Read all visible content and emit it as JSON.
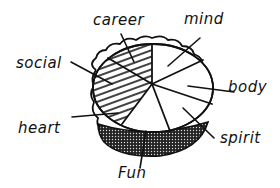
{
  "illustration": {
    "subject": "life balance pie",
    "ink_color": "#111111",
    "background_color": "#ffffff",
    "labels": {
      "career": "career",
      "mind": "mind",
      "social": "social",
      "body": "body",
      "heart": "heart",
      "spirit": "spirit",
      "fun": "Fun"
    }
  }
}
